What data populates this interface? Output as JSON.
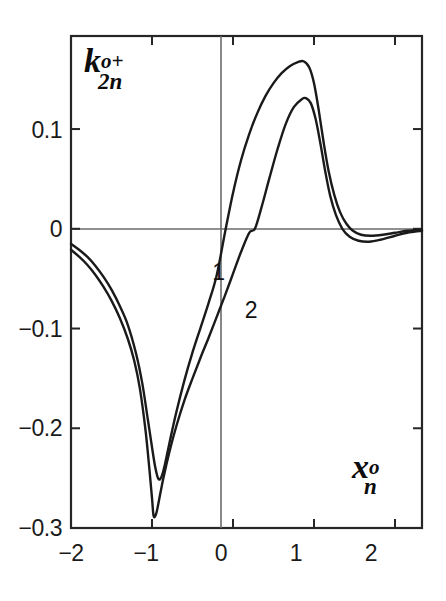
{
  "chart_data": {
    "type": "line",
    "title": "",
    "subtitle": "",
    "xlabel": "x_n^o",
    "ylabel": "k_2n^{o+}",
    "xlabel_parts": {
      "base": "x",
      "sup": "o",
      "sub": "n"
    },
    "ylabel_parts": {
      "base": "k",
      "sup": "o+",
      "sub": "2n"
    },
    "xlim": [
      -2.0,
      2.333
    ],
    "ylim": [
      -0.3,
      0.1933
    ],
    "xticks": [
      -2,
      -1,
      0,
      1,
      2
    ],
    "xtick_labels": [
      "−2",
      "−1",
      "0",
      "1",
      "2"
    ],
    "yticks": [
      0.1,
      0,
      -0.1,
      -0.2,
      -0.3
    ],
    "ytick_labels": [
      "0.1",
      "0",
      "−0.1",
      "−0.2",
      "−0.3"
    ],
    "grid": false,
    "legend": "inline-curve-labels",
    "zero_lines": {
      "horizontal": 0,
      "vertical": 0
    },
    "annotations": [
      {
        "text": "1",
        "x": -0.17,
        "y": -0.045,
        "data_name": "curve-label-1"
      },
      {
        "text": "2",
        "x": 0.23,
        "y": -0.083,
        "data_name": "curve-label-2"
      }
    ],
    "series": [
      {
        "name": "1",
        "label": "1",
        "color": "#1a1a1a",
        "peak": {
          "x": 0.87,
          "y": 0.168
        },
        "trough": {
          "x": -0.92,
          "y": -0.251
        },
        "zero_crossing": -0.09,
        "points": [
          [
            -2.0,
            -0.015
          ],
          [
            -1.9,
            -0.021
          ],
          [
            -1.8,
            -0.028
          ],
          [
            -1.7,
            -0.037
          ],
          [
            -1.6,
            -0.048
          ],
          [
            -1.5,
            -0.061
          ],
          [
            -1.4,
            -0.077
          ],
          [
            -1.3,
            -0.096
          ],
          [
            -1.2,
            -0.124
          ],
          [
            -1.12,
            -0.155
          ],
          [
            -1.05,
            -0.192
          ],
          [
            -1.0,
            -0.219
          ],
          [
            -0.96,
            -0.239
          ],
          [
            -0.92,
            -0.251
          ],
          [
            -0.88,
            -0.248
          ],
          [
            -0.84,
            -0.236
          ],
          [
            -0.78,
            -0.213
          ],
          [
            -0.7,
            -0.184
          ],
          [
            -0.6,
            -0.152
          ],
          [
            -0.5,
            -0.124
          ],
          [
            -0.4,
            -0.099
          ],
          [
            -0.3,
            -0.074
          ],
          [
            -0.2,
            -0.046
          ],
          [
            -0.09,
            0.0
          ],
          [
            0.0,
            0.036
          ],
          [
            0.1,
            0.069
          ],
          [
            0.2,
            0.095
          ],
          [
            0.3,
            0.116
          ],
          [
            0.4,
            0.133
          ],
          [
            0.5,
            0.146
          ],
          [
            0.6,
            0.156
          ],
          [
            0.7,
            0.163
          ],
          [
            0.8,
            0.167
          ],
          [
            0.87,
            0.168
          ],
          [
            0.94,
            0.162
          ],
          [
            1.0,
            0.146
          ],
          [
            1.06,
            0.118
          ],
          [
            1.12,
            0.086
          ],
          [
            1.18,
            0.058
          ],
          [
            1.25,
            0.034
          ],
          [
            1.32,
            0.017
          ],
          [
            1.4,
            0.005
          ],
          [
            1.48,
            -0.002
          ],
          [
            1.58,
            -0.006
          ],
          [
            1.7,
            -0.007
          ],
          [
            1.85,
            -0.006
          ],
          [
            2.0,
            -0.004
          ],
          [
            2.15,
            -0.002
          ],
          [
            2.333,
            -0.001
          ]
        ]
      },
      {
        "name": "2",
        "label": "2",
        "color": "#1a1a1a",
        "peak": {
          "x": 0.9,
          "y": 0.131
        },
        "trough": {
          "x": -0.98,
          "y": -0.288
        },
        "zero_crossing": 0.27,
        "points": [
          [
            -2.0,
            -0.021
          ],
          [
            -1.9,
            -0.028
          ],
          [
            -1.8,
            -0.036
          ],
          [
            -1.7,
            -0.046
          ],
          [
            -1.6,
            -0.058
          ],
          [
            -1.5,
            -0.072
          ],
          [
            -1.4,
            -0.089
          ],
          [
            -1.3,
            -0.11
          ],
          [
            -1.22,
            -0.132
          ],
          [
            -1.15,
            -0.16
          ],
          [
            -1.08,
            -0.202
          ],
          [
            -1.03,
            -0.243
          ],
          [
            -1.0,
            -0.27
          ],
          [
            -0.98,
            -0.288
          ],
          [
            -0.95,
            -0.286
          ],
          [
            -0.92,
            -0.275
          ],
          [
            -0.86,
            -0.25
          ],
          [
            -0.78,
            -0.222
          ],
          [
            -0.7,
            -0.198
          ],
          [
            -0.6,
            -0.172
          ],
          [
            -0.5,
            -0.15
          ],
          [
            -0.4,
            -0.129
          ],
          [
            -0.3,
            -0.109
          ],
          [
            -0.2,
            -0.088
          ],
          [
            -0.1,
            -0.067
          ],
          [
            0.0,
            -0.045
          ],
          [
            0.1,
            -0.023
          ],
          [
            0.2,
            -0.004
          ],
          [
            0.27,
            0.0
          ],
          [
            0.35,
            0.021
          ],
          [
            0.45,
            0.051
          ],
          [
            0.55,
            0.08
          ],
          [
            0.65,
            0.105
          ],
          [
            0.75,
            0.122
          ],
          [
            0.85,
            0.13
          ],
          [
            0.9,
            0.131
          ],
          [
            0.96,
            0.126
          ],
          [
            1.02,
            0.11
          ],
          [
            1.08,
            0.085
          ],
          [
            1.14,
            0.057
          ],
          [
            1.2,
            0.033
          ],
          [
            1.27,
            0.014
          ],
          [
            1.35,
            0.0
          ],
          [
            1.44,
            -0.008
          ],
          [
            1.55,
            -0.012
          ],
          [
            1.68,
            -0.013
          ],
          [
            1.82,
            -0.011
          ],
          [
            2.0,
            -0.007
          ],
          [
            2.15,
            -0.004
          ],
          [
            2.333,
            -0.002
          ]
        ]
      }
    ]
  },
  "plot": {
    "frame_color": "#262626",
    "axis_color": "#4d4d4d",
    "curve_color": "#1a1a1a",
    "background": "#ffffff"
  }
}
